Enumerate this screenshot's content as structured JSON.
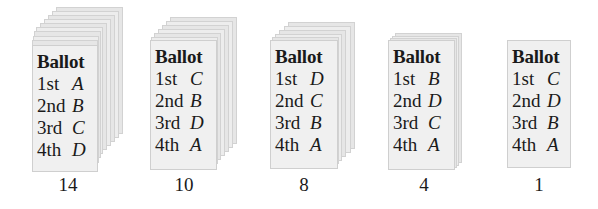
{
  "figure": {
    "ballot_title": "Ballot",
    "stacks": [
      {
        "count": "14",
        "rankings": [
          {
            "rank": "1st",
            "candidate": "A"
          },
          {
            "rank": "2nd",
            "candidate": "B"
          },
          {
            "rank": "3rd",
            "candidate": "C"
          },
          {
            "rank": "4th",
            "candidate": "D"
          }
        ]
      },
      {
        "count": "10",
        "rankings": [
          {
            "rank": "1st",
            "candidate": "C"
          },
          {
            "rank": "2nd",
            "candidate": "B"
          },
          {
            "rank": "3rd",
            "candidate": "D"
          },
          {
            "rank": "4th",
            "candidate": "A"
          }
        ]
      },
      {
        "count": "8",
        "rankings": [
          {
            "rank": "1st",
            "candidate": "D"
          },
          {
            "rank": "2nd",
            "candidate": "C"
          },
          {
            "rank": "3rd",
            "candidate": "B"
          },
          {
            "rank": "4th",
            "candidate": "A"
          }
        ]
      },
      {
        "count": "4",
        "rankings": [
          {
            "rank": "1st",
            "candidate": "B"
          },
          {
            "rank": "2nd",
            "candidate": "D"
          },
          {
            "rank": "3rd",
            "candidate": "C"
          },
          {
            "rank": "4th",
            "candidate": "A"
          }
        ]
      },
      {
        "count": "1",
        "rankings": [
          {
            "rank": "1st",
            "candidate": "C"
          },
          {
            "rank": "2nd",
            "candidate": "D"
          },
          {
            "rank": "3rd",
            "candidate": "B"
          },
          {
            "rank": "4th",
            "candidate": "A"
          }
        ]
      }
    ]
  },
  "colors": {
    "ballot_face": "#f0f0f0",
    "ballot_edge": "#cfcfcf",
    "text": "#1a1a1a"
  }
}
